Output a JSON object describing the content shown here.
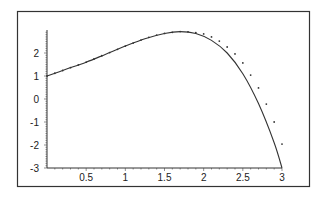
{
  "chart_data": {
    "type": "line",
    "title": "",
    "xlabel": "",
    "ylabel": "",
    "xlim": [
      0,
      3
    ],
    "ylim": [
      -3,
      3
    ],
    "grid": false,
    "legend": null,
    "x_ticks": [
      "0.5",
      "1",
      "1.5",
      "2",
      "2.5",
      "3"
    ],
    "x_tick_values": [
      0.5,
      1,
      1.5,
      2,
      2.5,
      3
    ],
    "y_ticks": [
      "-3",
      "-2",
      "-1",
      "0",
      "1",
      "2"
    ],
    "y_tick_values": [
      -3,
      -2,
      -1,
      0,
      1,
      2
    ],
    "series": [
      {
        "name": "curve",
        "style": "solid",
        "x": [
          0,
          0.25,
          0.5,
          0.75,
          1.0,
          1.25,
          1.5,
          1.7,
          1.9,
          2.1,
          2.3,
          2.5,
          2.7,
          2.9,
          3.0
        ],
        "y": [
          1.0,
          1.3,
          1.6,
          1.95,
          2.3,
          2.62,
          2.85,
          2.93,
          2.85,
          2.55,
          2.0,
          1.1,
          -0.2,
          -1.9,
          -3.0
        ]
      },
      {
        "name": "points",
        "style": "dotted",
        "x": [
          0,
          0.1,
          0.2,
          0.3,
          0.4,
          0.5,
          0.6,
          0.7,
          0.8,
          0.9,
          1.0,
          1.1,
          1.2,
          1.3,
          1.4,
          1.5,
          1.6,
          1.7,
          1.8,
          1.9,
          2.0,
          2.1,
          2.2,
          2.3,
          2.4,
          2.5,
          2.6,
          2.7,
          2.8,
          2.9,
          3.0
        ],
        "y": [
          1.0,
          1.12,
          1.24,
          1.36,
          1.48,
          1.6,
          1.74,
          1.88,
          2.02,
          2.16,
          2.3,
          2.43,
          2.56,
          2.68,
          2.78,
          2.85,
          2.9,
          2.93,
          2.92,
          2.88,
          2.83,
          2.7,
          2.52,
          2.26,
          1.96,
          1.57,
          1.04,
          0.48,
          -0.22,
          -1.0,
          -1.96
        ]
      }
    ]
  }
}
